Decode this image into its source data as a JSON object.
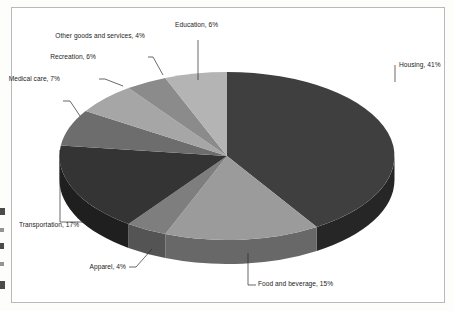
{
  "chart_data": {
    "type": "pie",
    "title": "",
    "subtitle": "",
    "xlabel": "",
    "ylabel": "",
    "legend_position": "none",
    "grid": false,
    "style": "3d-pie",
    "units": "percent",
    "categories": [
      "Housing",
      "Food and beverage",
      "Apparel",
      "Transportation",
      "Medical care",
      "Recreation",
      "Other goods and services",
      "Education"
    ],
    "values": [
      41,
      15,
      4,
      17,
      7,
      6,
      4,
      6
    ],
    "labels": [
      "Housing, 41%",
      "Food and beverage, 15%",
      "Apparel, 4%",
      "Transportation, 17%",
      "Medical care, 7%",
      "Recreation, 6%",
      "Other goods and services, 4%",
      "Education, 6%"
    ],
    "colors": [
      "#3f3f3f",
      "#9b9b9b",
      "#7e7e7e",
      "#343434",
      "#6d6d6d",
      "#a6a6a6",
      "#8b8b8b",
      "#b4b4b4"
    ],
    "side_colors": [
      "#262626",
      "#686868",
      "#545454",
      "#1f1f1f",
      "#474747",
      "#707070",
      "#5d5d5d",
      "#797979"
    ]
  },
  "slices": [
    {
      "name": "Housing",
      "label": "Housing, 41%",
      "value": 41,
      "percent": "41%"
    },
    {
      "name": "Food and beverage",
      "label": "Food and beverage, 15%",
      "value": 15,
      "percent": "15%"
    },
    {
      "name": "Apparel",
      "label": "Apparel, 4%",
      "value": 4,
      "percent": "4%"
    },
    {
      "name": "Transportation",
      "label": "Transportation, 17%",
      "value": 17,
      "percent": "17%"
    },
    {
      "name": "Medical care",
      "label": "Medical care, 7%",
      "value": 7,
      "percent": "7%"
    },
    {
      "name": "Recreation",
      "label": "Recreation, 6%",
      "value": 6,
      "percent": "6%"
    },
    {
      "name": "Other goods and services",
      "label": "Other goods and services, 4%",
      "value": 4,
      "percent": "4%"
    },
    {
      "name": "Education",
      "label": "Education, 6%",
      "value": 6,
      "percent": "6%"
    }
  ]
}
